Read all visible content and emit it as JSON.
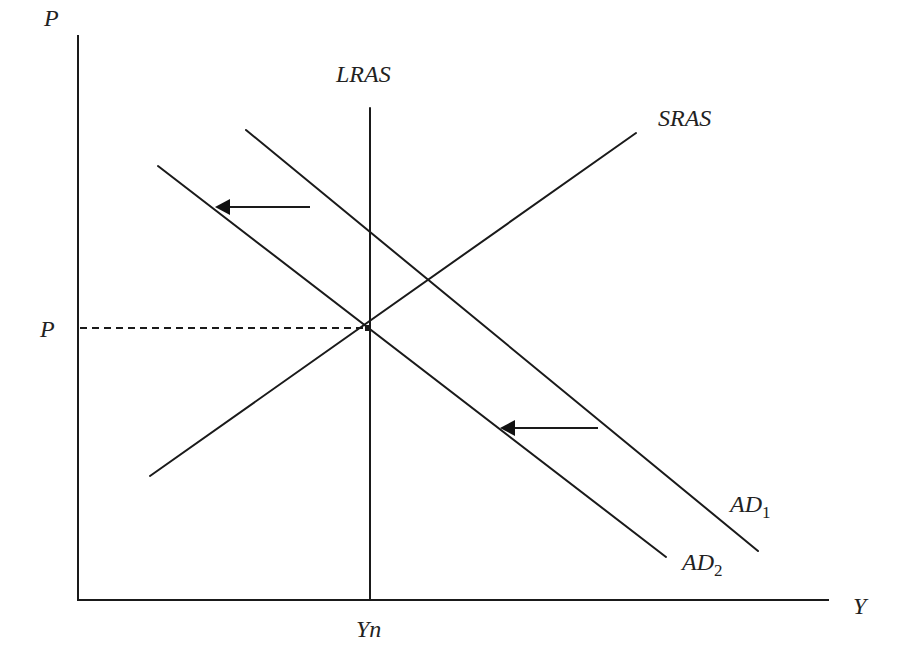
{
  "diagram": {
    "type": "economics-AD-AS",
    "axes": {
      "y_label": "P",
      "x_label": "Y",
      "p_level_label": "P",
      "yn_label": "Yn"
    },
    "curves": {
      "lras": {
        "label": "LRAS",
        "x1": 370,
        "y1": 108,
        "x2": 370,
        "y2": 600
      },
      "sras": {
        "label": "SRAS",
        "x1": 150,
        "y1": 476,
        "x2": 636,
        "y2": 133
      },
      "ad1": {
        "label": "AD",
        "subscript": "1",
        "x1": 246,
        "y1": 130,
        "x2": 758,
        "y2": 551
      },
      "ad2": {
        "label": "AD",
        "subscript": "2",
        "x1": 158,
        "y1": 166,
        "x2": 666,
        "y2": 557
      }
    },
    "equilibrium": {
      "x": 368,
      "y": 328
    },
    "arrows": [
      {
        "name": "shift-arrow-upper",
        "from": [
          310,
          207
        ],
        "to": [
          215,
          207
        ]
      },
      {
        "name": "shift-arrow-lower",
        "from": [
          598,
          428
        ],
        "to": [
          500,
          428
        ]
      }
    ],
    "colors": {
      "line": "#1a1a1a",
      "text": "#222222",
      "background": "#ffffff"
    }
  }
}
